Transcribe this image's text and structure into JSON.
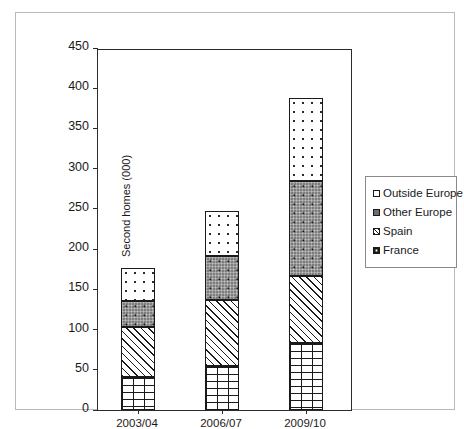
{
  "chart_data": {
    "type": "bar",
    "stacked": true,
    "title": "",
    "subtitle": "",
    "xlabel": "",
    "ylabel": "Second homes (000)",
    "categories": [
      "2003/04",
      "2006/07",
      "2009/10"
    ],
    "ylim": [
      0,
      450
    ],
    "ytick_step": 50,
    "ytick_labels": [
      "0",
      "50",
      "100",
      "150",
      "200",
      "250",
      "300",
      "350",
      "400",
      "450"
    ],
    "grid": false,
    "legend_position": "right",
    "series": [
      {
        "name": "France",
        "pattern": "brick",
        "values": [
          41,
          55,
          83
        ]
      },
      {
        "name": "Spain",
        "pattern": "diagonal-hatch",
        "values": [
          62,
          82,
          84
        ]
      },
      {
        "name": "Other Europe",
        "pattern": "dark-dotted",
        "values": [
          32,
          55,
          118
        ]
      },
      {
        "name": "Outside Europe",
        "pattern": "light-dotted",
        "values": [
          41,
          55,
          103
        ]
      }
    ],
    "stack_totals": [
      176,
      247,
      388
    ],
    "legend_entries": [
      {
        "label": "Outside Europe",
        "swatch": "light-dotted"
      },
      {
        "label": "Other Europe",
        "swatch": "dark-dotted"
      },
      {
        "label": "Spain",
        "swatch": "diagonal-hatch"
      },
      {
        "label": "France",
        "swatch": "brick"
      }
    ]
  },
  "colors": {
    "axis": "#2b2b2b",
    "frame": "#b9b9b9",
    "text": "#1a1a1a",
    "other_europe_fill": "#7d7d7d",
    "background": "#ffffff"
  }
}
